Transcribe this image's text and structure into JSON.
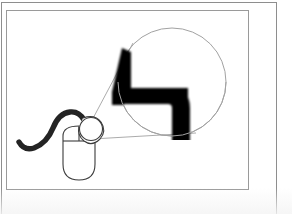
{
  "document": {
    "type": "slide-illustration",
    "background_color": "#ffffff",
    "outer_frame_color": "#8e8e8e",
    "inner_frame_color": "#9a9a9a"
  },
  "illustration": {
    "title": "",
    "caption": "",
    "description": "Line drawing of a computer mouse with a cable, with a magnifier circle enlarging a blurred mouse-pointer arrow",
    "elements": [
      {
        "name": "computer-mouse",
        "label": "",
        "stroke_color": "#3b3b3b",
        "fill_color": "#ffffff",
        "position": {
          "x": 62,
          "y": 122,
          "width": 46,
          "height": 58
        }
      },
      {
        "name": "mouse-cable",
        "label": "",
        "stroke_color": "#242424",
        "position": {
          "x": 18,
          "y": 112,
          "width": 66,
          "height": 40
        }
      },
      {
        "name": "scroll-wheel",
        "label": "",
        "stroke_color": "#3b3b3b",
        "position": {
          "x": 84,
          "y": 116,
          "width": 24,
          "height": 24
        }
      },
      {
        "name": "magnifier-circle",
        "label": "",
        "stroke_color": "#a2a2a2",
        "position": {
          "x": 118,
          "y": 28,
          "width": 108,
          "height": 108
        }
      },
      {
        "name": "magnifier-connector-upper",
        "label": "",
        "stroke_color": "#a2a2a2"
      },
      {
        "name": "magnifier-connector-lower",
        "label": "",
        "stroke_color": "#a2a2a2"
      },
      {
        "name": "magnified-cursor-arrow",
        "label": "",
        "fill_color": "#000000",
        "blurred": "true",
        "position": {
          "x": 110,
          "y": 48,
          "width": 76,
          "height": 92
        }
      }
    ]
  },
  "colors": {
    "ink": "#000000",
    "line": "#3b3b3b",
    "thin_line": "#a2a2a2",
    "frame": "#8e8e8e",
    "paper": "#ffffff"
  }
}
